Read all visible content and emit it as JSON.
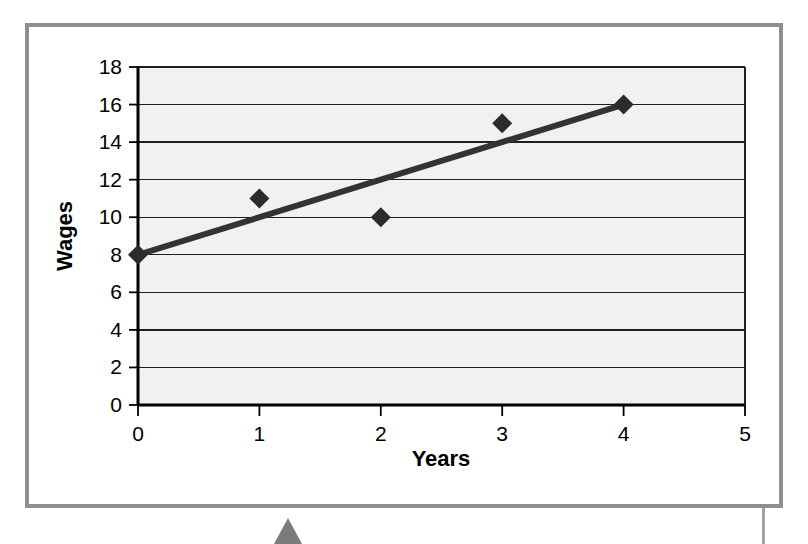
{
  "figure": {
    "frame_color": "#8f8f8f",
    "background_color": "#ffffff",
    "plot_background_color": "#f1f1f1",
    "marker_triangle_color": "#7b7b7b"
  },
  "chart_data": {
    "type": "scatter",
    "title": "",
    "xlabel": "Years",
    "ylabel": "Wages",
    "xlim": [
      0,
      5
    ],
    "ylim": [
      0,
      18
    ],
    "xticks": [
      0,
      1,
      2,
      3,
      4,
      5
    ],
    "yticks": [
      0,
      2,
      4,
      6,
      8,
      10,
      12,
      14,
      16,
      18
    ],
    "xtick_labels": [
      "0",
      "1",
      "2",
      "3",
      "4",
      "5"
    ],
    "ytick_labels": [
      "0",
      "2",
      "4",
      "6",
      "8",
      "10",
      "12",
      "14",
      "16",
      "18"
    ],
    "grid": "horizontal",
    "legend": "none",
    "series": [
      {
        "name": "Wages",
        "marker": "diamond",
        "marker_color": "#2b2b2b",
        "x": [
          0,
          1,
          2,
          3,
          4
        ],
        "y": [
          8,
          11,
          10,
          15,
          16
        ],
        "points": [
          {
            "x": 0,
            "y": 8
          },
          {
            "x": 1,
            "y": 11
          },
          {
            "x": 2,
            "y": 10
          },
          {
            "x": 3,
            "y": 15
          },
          {
            "x": 4,
            "y": 16
          }
        ]
      },
      {
        "name": "Trendline",
        "type": "line",
        "line_color": "#333333",
        "x": [
          0,
          4
        ],
        "y": [
          8,
          16
        ]
      }
    ]
  }
}
